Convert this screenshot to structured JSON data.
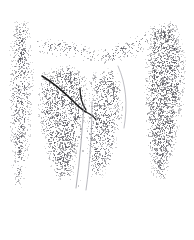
{
  "artwork": {
    "title": "Stippled anatomical line illustration",
    "medium": "pen-and-ink stipple drawing",
    "subject": "vertical cleft form flanked by two stippled columns with a dark forked line at center-left",
    "background_color": "#ffffff",
    "stipple_color": "#4a4a52",
    "line_color": "#1a1a1a",
    "canvas": {
      "width": 194,
      "height": 202
    }
  },
  "chart_data": {
    "type": "scatter",
    "xlabel": "",
    "ylabel": "",
    "xlim": [
      0,
      194
    ],
    "ylim": [
      0,
      202
    ],
    "grid": false,
    "legend": "none",
    "regions": [
      {
        "name": "left-column-band",
        "description": "narrow vertical stippled band along the left edge",
        "density": 0.55,
        "tone": "medium",
        "polygon": [
          [
            14,
            18
          ],
          [
            30,
            22
          ],
          [
            34,
            70
          ],
          [
            32,
            120
          ],
          [
            28,
            160
          ],
          [
            22,
            188
          ],
          [
            14,
            186
          ],
          [
            10,
            150
          ],
          [
            8,
            90
          ],
          [
            10,
            46
          ]
        ]
      },
      {
        "name": "upper-arch-sweep",
        "description": "curved arch of stipple sweeping across the upper middle",
        "density": 0.3,
        "tone": "light",
        "polygon": [
          [
            34,
            40
          ],
          [
            62,
            36
          ],
          [
            96,
            48
          ],
          [
            124,
            40
          ],
          [
            150,
            30
          ],
          [
            158,
            44
          ],
          [
            136,
            58
          ],
          [
            108,
            66
          ],
          [
            78,
            60
          ],
          [
            52,
            56
          ],
          [
            36,
            54
          ]
        ]
      },
      {
        "name": "central-mass-left",
        "description": "central stippled body left of the light channel",
        "density": 0.6,
        "tone": "medium-dark",
        "polygon": [
          [
            42,
            72
          ],
          [
            70,
            62
          ],
          [
            88,
            78
          ],
          [
            86,
            110
          ],
          [
            80,
            150
          ],
          [
            72,
            182
          ],
          [
            56,
            180
          ],
          [
            44,
            150
          ],
          [
            38,
            116
          ],
          [
            38,
            90
          ]
        ]
      },
      {
        "name": "central-mass-right",
        "description": "central stippled body right of the light channel",
        "density": 0.52,
        "tone": "medium",
        "polygon": [
          [
            92,
            72
          ],
          [
            114,
            66
          ],
          [
            124,
            90
          ],
          [
            122,
            124
          ],
          [
            114,
            158
          ],
          [
            102,
            180
          ],
          [
            88,
            176
          ],
          [
            86,
            140
          ],
          [
            88,
            104
          ],
          [
            88,
            84
          ]
        ]
      },
      {
        "name": "right-column-band",
        "description": "wide dense vertical stippled band along the right edge",
        "density": 0.72,
        "tone": "dark",
        "polygon": [
          [
            150,
            26
          ],
          [
            176,
            20
          ],
          [
            186,
            56
          ],
          [
            184,
            104
          ],
          [
            176,
            146
          ],
          [
            166,
            180
          ],
          [
            152,
            176
          ],
          [
            146,
            136
          ],
          [
            144,
            92
          ],
          [
            146,
            52
          ]
        ]
      },
      {
        "name": "light-channel",
        "description": "pale vertical cleft running down from the fork to the lower edge",
        "density": 0.04,
        "tone": "near-white",
        "polygon": [
          [
            84,
            100
          ],
          [
            92,
            100
          ],
          [
            90,
            140
          ],
          [
            86,
            172
          ],
          [
            80,
            190
          ],
          [
            76,
            186
          ],
          [
            80,
            150
          ],
          [
            82,
            124
          ]
        ]
      }
    ],
    "strokes": [
      {
        "name": "main-dark-sweep",
        "description": "dark curved line sweeping from upper-left down to the central fork",
        "path": "M 42 76 C 52 82, 64 92, 74 102 C 78 106, 82 110, 86 112",
        "width": 1.6,
        "color": "#1a1a1a"
      },
      {
        "name": "fork-upper-tine",
        "description": "short upward hook rising from the fork junction",
        "path": "M 80 88 C 80 96, 82 104, 86 110",
        "width": 1.3,
        "color": "#1a1a1a"
      },
      {
        "name": "fork-lower-tine",
        "description": "short stroke descending right from the fork junction",
        "path": "M 86 112 C 90 114, 94 116, 96 120",
        "width": 1.3,
        "color": "#262626"
      },
      {
        "name": "channel-contour-left",
        "description": "faint contour line bounding the light channel on the left",
        "path": "M 84 104 C 82 132, 80 160, 76 188",
        "width": 0.7,
        "color": "#8d8d95"
      },
      {
        "name": "channel-contour-right",
        "description": "faint contour line bounding the light channel on the right",
        "path": "M 92 102 C 92 132, 90 162, 86 190",
        "width": 0.7,
        "color": "#9a9aa2"
      },
      {
        "name": "upper-right-contour",
        "description": "faint contour separating central mass from the right band",
        "path": "M 118 66 C 126 84, 128 104, 124 128",
        "width": 0.7,
        "color": "#a2a2aa"
      }
    ],
    "dot_count_estimate": 2400,
    "dot_size_range_px": [
      0.6,
      1.6
    ]
  }
}
